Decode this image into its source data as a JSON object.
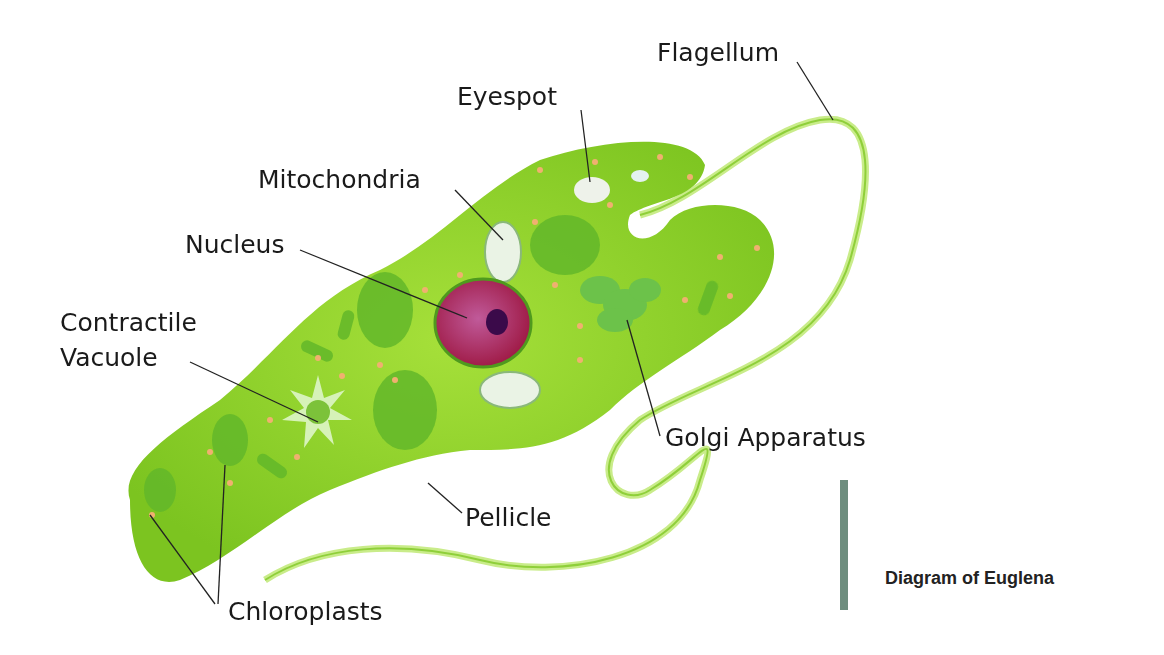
{
  "title": "Diagram of Euglena",
  "labels": {
    "flagellum": "Flagellum",
    "eyespot": "Eyespot",
    "mitochondria": "Mitochondria",
    "nucleus": "Nucleus",
    "contractile_vacuole_1": "Contractile",
    "contractile_vacuole_2": "Vacuole",
    "golgi": "Golgi Apparatus",
    "pellicle": "Pellicle",
    "chloroplasts": "Chloroplasts"
  },
  "colors": {
    "body": "#8cd42a",
    "body_dark": "#5fae1e",
    "nucleus": "#a3204e",
    "nucleolus": "#3b0a4a",
    "granule": "#f0b070",
    "caption_bar": "#6e8d7e"
  }
}
